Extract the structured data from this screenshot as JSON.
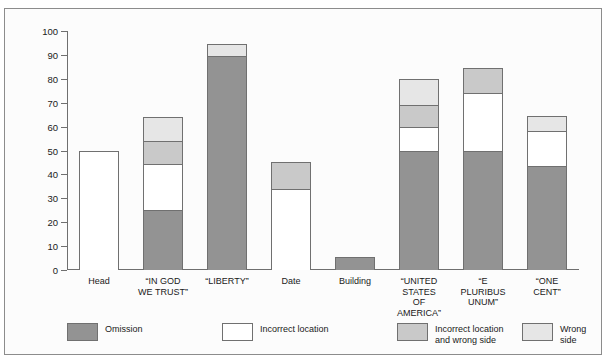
{
  "figure": {
    "top_sliver_text": "......",
    "y_axis_title": "Error (percent)"
  },
  "chart_data": {
    "type": "bar",
    "subtype": "stacked-bar",
    "title": "",
    "xlabel": "",
    "ylabel": "Error (percent)",
    "ylim": [
      0,
      100
    ],
    "yticks": [
      0,
      10,
      20,
      30,
      40,
      50,
      60,
      70,
      80,
      90,
      100
    ],
    "ytick_labels": [
      "0",
      "10",
      "20",
      "30",
      "40",
      "50",
      "60",
      "70",
      "80",
      "90",
      "100"
    ],
    "grid": false,
    "legend_position": "bottom",
    "categories": [
      "Head",
      "“IN GOD\nWE TRUST”",
      "“LIBERTY”",
      "Date",
      "Building",
      "“UNITED\nSTATES\nOF\nAMERICA”",
      "“E\nPLURIBUS\nUNUM”",
      "“ONE\nCENT”"
    ],
    "series": [
      {
        "name": "Omission",
        "color": "#939393",
        "values": [
          0,
          25,
          89.5,
          0,
          5.5,
          50,
          50,
          43.5
        ]
      },
      {
        "name": "Incorrect location",
        "color": "#ffffff",
        "values": [
          50,
          19.5,
          0,
          34,
          0,
          10,
          24,
          14.5
        ]
      },
      {
        "name": "Incorrect location and wrong side",
        "color": "#c9c9c9",
        "values": [
          0,
          9.5,
          0,
          11,
          0,
          9,
          10.5,
          0
        ]
      },
      {
        "name": "Wrong side",
        "color": "#e6e6e6",
        "values": [
          0,
          10,
          5,
          0,
          0,
          11,
          0,
          6.5
        ]
      }
    ],
    "totals": [
      50,
      64,
      94.5,
      45,
      5.5,
      80,
      84.5,
      64.5
    ]
  },
  "legend": {
    "items": [
      {
        "label": "Omission",
        "color": "#939393"
      },
      {
        "label": "Incorrect location",
        "color": "#ffffff"
      },
      {
        "label": "Incorrect location\nand wrong side",
        "color": "#c9c9c9"
      },
      {
        "label": "Wrong side",
        "color": "#e6e6e6"
      }
    ]
  }
}
